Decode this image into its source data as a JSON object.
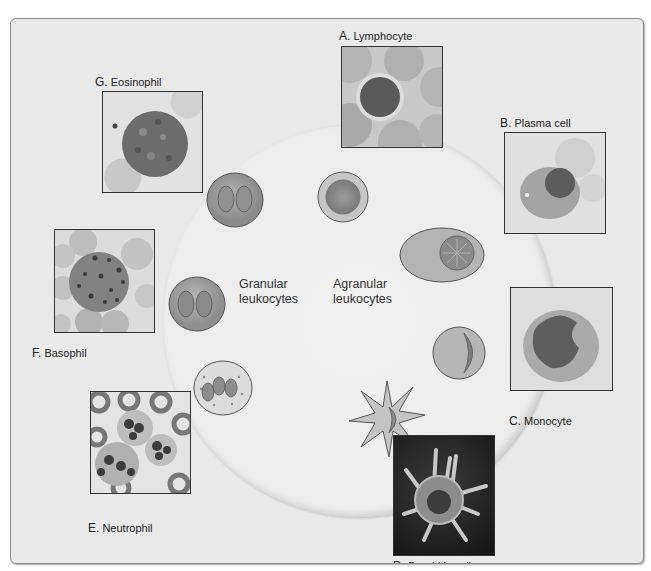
{
  "diagram": {
    "center_labels": {
      "granular": [
        "Granular",
        "leukocytes"
      ],
      "agranular": [
        "Agranular",
        "leukocytes"
      ]
    },
    "panels": [
      {
        "letter": "A.",
        "name": "Lymphocyte",
        "group": "agranular"
      },
      {
        "letter": "B.",
        "name": "Plasma cell",
        "group": "agranular"
      },
      {
        "letter": "C.",
        "name": "Monocyte",
        "group": "agranular"
      },
      {
        "letter": "D.",
        "name": "Dendritic cell",
        "group": "agranular"
      },
      {
        "letter": "E.",
        "name": "Neutrophil",
        "group": "granular"
      },
      {
        "letter": "F.",
        "name": "Basophil",
        "group": "granular"
      },
      {
        "letter": "G.",
        "name": "Eosinophil",
        "group": "granular"
      }
    ],
    "colors": {
      "background": "#e9e9e9",
      "circle": "#efefef",
      "frame_border": "#8a8a8a",
      "text": "#222222"
    }
  }
}
